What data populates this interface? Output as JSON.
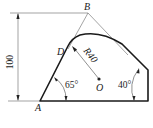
{
  "diagram": {
    "points": {
      "A": {
        "label": "A"
      },
      "B": {
        "label": "B"
      },
      "D": {
        "label": "D"
      },
      "O": {
        "label": "O"
      }
    },
    "dimensions": {
      "height": "100",
      "radius": "R40",
      "angle_left": "65°",
      "angle_right": "40°"
    },
    "colors": {
      "line": "#222222",
      "thin": "#555555",
      "background": "#ffffff"
    }
  }
}
